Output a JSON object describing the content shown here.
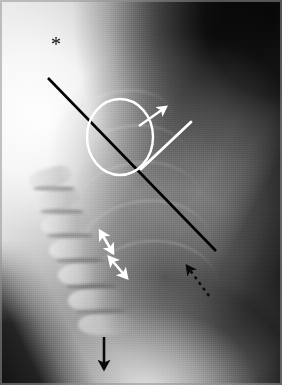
{
  "figure": {
    "modality": "radiograph",
    "view": "lateral thoracic spine / chest",
    "width": 282,
    "height": 385,
    "background_color": "#b9b9b9",
    "border_color": "#949494"
  },
  "annotations": {
    "asterisk": {
      "name": "asterisk-marker",
      "glyph": "*",
      "color": "#0a0a0a",
      "x": 57,
      "y": 43,
      "font_size": 20
    },
    "solid_black_line": {
      "name": "black-diagonal-line",
      "color": "#000000",
      "x1": 48,
      "y1": 78,
      "x2": 216,
      "y2": 251,
      "stroke_width": 2.6
    },
    "white_circle": {
      "name": "white-circle-marker",
      "color": "#ffffff",
      "cx": 120,
      "cy": 137,
      "rx": 33,
      "ry": 38,
      "stroke_width": 2.4
    },
    "white_arrow": {
      "name": "white-arrow-up-right",
      "color": "#ffffff",
      "x1": 139,
      "y1": 126,
      "x2": 166,
      "y2": 107,
      "stroke_width": 2.4
    },
    "white_line": {
      "name": "white-oblique-line",
      "color": "#ffffff",
      "x1": 191,
      "y1": 122,
      "x2": 141,
      "y2": 169,
      "stroke_width": 2.8
    },
    "white_double_arrow_upper": {
      "name": "white-double-arrow-upper",
      "color": "#ffffff",
      "x1": 100,
      "y1": 231,
      "x2": 113,
      "y2": 253,
      "stroke_width": 2.6
    },
    "white_double_arrow_lower": {
      "name": "white-double-arrow-lower",
      "color": "#ffffff",
      "x1": 109,
      "y1": 257,
      "x2": 127,
      "y2": 278,
      "stroke_width": 2.6
    },
    "dashed_black_arrow": {
      "name": "black-dashed-arrow-up-left",
      "color": "#0a0a0a",
      "x1": 209,
      "y1": 296,
      "x2": 187,
      "y2": 266,
      "stroke_width": 2.4,
      "dash_pattern": "3 4"
    },
    "black_down_arrow": {
      "name": "black-down-arrow",
      "color": "#0a0a0a",
      "x1": 104,
      "y1": 337,
      "x2": 104,
      "y2": 369,
      "stroke_width": 2.6
    }
  },
  "anatomy": {
    "vertebrae": [
      {
        "x": 28,
        "y": 168,
        "w": 44,
        "h": 19,
        "rot": -14
      },
      {
        "x": 34,
        "y": 190,
        "w": 46,
        "h": 20,
        "rot": -12
      },
      {
        "x": 41,
        "y": 213,
        "w": 48,
        "h": 21,
        "rot": -10
      },
      {
        "x": 49,
        "y": 237,
        "w": 50,
        "h": 22,
        "rot": -8
      },
      {
        "x": 58,
        "y": 262,
        "w": 52,
        "h": 23,
        "rot": -6
      },
      {
        "x": 68,
        "y": 288,
        "w": 54,
        "h": 23,
        "rot": -4
      },
      {
        "x": 78,
        "y": 313,
        "w": 54,
        "h": 22,
        "rot": -2
      }
    ],
    "discs": [
      {
        "x": 33,
        "y": 186,
        "w": 42,
        "h": 5
      },
      {
        "x": 40,
        "y": 209,
        "w": 44,
        "h": 5
      },
      {
        "x": 47,
        "y": 233,
        "w": 46,
        "h": 5
      },
      {
        "x": 56,
        "y": 258,
        "w": 48,
        "h": 5
      },
      {
        "x": 66,
        "y": 284,
        "w": 50,
        "h": 5
      },
      {
        "x": 76,
        "y": 309,
        "w": 50,
        "h": 5
      }
    ],
    "ribs": [
      {
        "x": 56,
        "y": 92,
        "w": 120,
        "h": 78,
        "rot": -18
      },
      {
        "x": 64,
        "y": 126,
        "w": 126,
        "h": 84,
        "rot": -14
      },
      {
        "x": 72,
        "y": 162,
        "w": 130,
        "h": 88,
        "rot": -10
      },
      {
        "x": 80,
        "y": 200,
        "w": 132,
        "h": 92,
        "rot": -6
      },
      {
        "x": 88,
        "y": 240,
        "w": 130,
        "h": 92,
        "rot": -2
      }
    ]
  }
}
